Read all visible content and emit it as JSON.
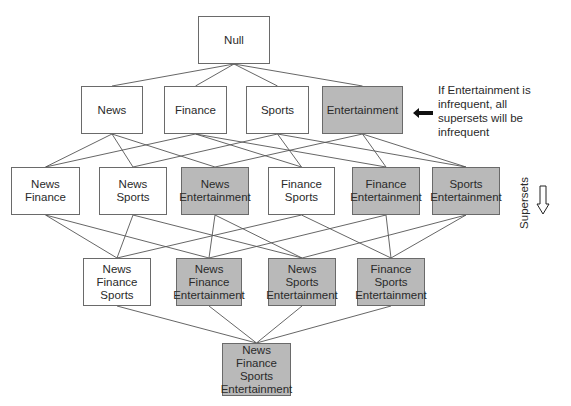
{
  "diagram": {
    "colors": {
      "frequent": "#ffffff",
      "infrequent": "#b9b9b9",
      "border": "#6a6a6a",
      "line": "#555555"
    },
    "nodes": [
      {
        "id": "null",
        "lines": [
          "Null"
        ],
        "infrequent": false,
        "x": 198,
        "y": 16,
        "w": 72,
        "h": 48
      },
      {
        "id": "n",
        "lines": [
          "News"
        ],
        "infrequent": false,
        "x": 81,
        "y": 86,
        "w": 62,
        "h": 48
      },
      {
        "id": "f",
        "lines": [
          "Finance"
        ],
        "infrequent": false,
        "x": 164,
        "y": 86,
        "w": 63,
        "h": 48
      },
      {
        "id": "s",
        "lines": [
          "Sports"
        ],
        "infrequent": false,
        "x": 246,
        "y": 86,
        "w": 63,
        "h": 48
      },
      {
        "id": "e",
        "lines": [
          "Entertainment"
        ],
        "infrequent": true,
        "x": 322,
        "y": 86,
        "w": 81,
        "h": 48
      },
      {
        "id": "nf",
        "lines": [
          "News",
          "Finance"
        ],
        "infrequent": false,
        "x": 11,
        "y": 167,
        "w": 69,
        "h": 48
      },
      {
        "id": "ns",
        "lines": [
          "News",
          "Sports"
        ],
        "infrequent": false,
        "x": 99,
        "y": 167,
        "w": 68,
        "h": 48
      },
      {
        "id": "ne",
        "lines": [
          "News",
          "Entertainment"
        ],
        "infrequent": true,
        "x": 181,
        "y": 167,
        "w": 68,
        "h": 48
      },
      {
        "id": "fs",
        "lines": [
          "Finance",
          "Sports"
        ],
        "infrequent": false,
        "x": 268,
        "y": 167,
        "w": 67,
        "h": 48
      },
      {
        "id": "fe",
        "lines": [
          "Finance",
          "Entertainment"
        ],
        "infrequent": true,
        "x": 352,
        "y": 167,
        "w": 68,
        "h": 48
      },
      {
        "id": "se",
        "lines": [
          "Sports",
          "Entertainment"
        ],
        "infrequent": true,
        "x": 432,
        "y": 167,
        "w": 68,
        "h": 48
      },
      {
        "id": "nfs",
        "lines": [
          "News",
          "Finance",
          "Sports"
        ],
        "infrequent": false,
        "x": 83,
        "y": 258,
        "w": 68,
        "h": 48
      },
      {
        "id": "nfe",
        "lines": [
          "News",
          "Finance",
          "Entertainment"
        ],
        "infrequent": true,
        "x": 176,
        "y": 258,
        "w": 66,
        "h": 48
      },
      {
        "id": "nse",
        "lines": [
          "News",
          "Sports",
          "Entertainment"
        ],
        "infrequent": true,
        "x": 268,
        "y": 258,
        "w": 68,
        "h": 48
      },
      {
        "id": "fse",
        "lines": [
          "Finance",
          "Sports",
          "Entertainment"
        ],
        "infrequent": true,
        "x": 357,
        "y": 258,
        "w": 68,
        "h": 48
      },
      {
        "id": "nfse",
        "lines": [
          "News",
          "Finance",
          "Sports",
          "Entertainment"
        ],
        "infrequent": true,
        "x": 222,
        "y": 343,
        "w": 69,
        "h": 53
      }
    ],
    "edges": [
      [
        "null",
        "n"
      ],
      [
        "null",
        "f"
      ],
      [
        "null",
        "s"
      ],
      [
        "null",
        "e"
      ],
      [
        "n",
        "nf"
      ],
      [
        "n",
        "ns"
      ],
      [
        "n",
        "ne"
      ],
      [
        "f",
        "nf"
      ],
      [
        "f",
        "fs"
      ],
      [
        "f",
        "fe"
      ],
      [
        "s",
        "ns"
      ],
      [
        "s",
        "fs"
      ],
      [
        "s",
        "se"
      ],
      [
        "e",
        "ne"
      ],
      [
        "e",
        "fe"
      ],
      [
        "e",
        "se"
      ],
      [
        "nf",
        "nfs"
      ],
      [
        "nf",
        "nfe"
      ],
      [
        "ns",
        "nfs"
      ],
      [
        "ns",
        "nse"
      ],
      [
        "ne",
        "nfe"
      ],
      [
        "ne",
        "nse"
      ],
      [
        "fs",
        "nfs"
      ],
      [
        "fs",
        "fse"
      ],
      [
        "fe",
        "nfe"
      ],
      [
        "fe",
        "fse"
      ],
      [
        "se",
        "nse"
      ],
      [
        "se",
        "fse"
      ],
      [
        "nfs",
        "nfse"
      ],
      [
        "nfe",
        "nfse"
      ],
      [
        "nse",
        "nfse"
      ],
      [
        "fse",
        "nfse"
      ]
    ],
    "annotation": {
      "lines": [
        "If Entertainment is",
        "infrequent, all",
        "supersets will be",
        "infrequent"
      ]
    },
    "direction_label": "Supersets"
  }
}
